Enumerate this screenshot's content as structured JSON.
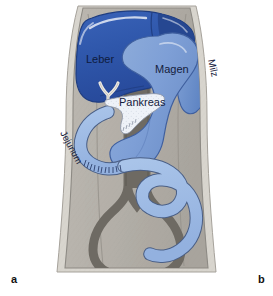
{
  "figure": {
    "panel_letters": {
      "left": "a",
      "right": "b"
    },
    "background_color": "#ffffff"
  },
  "labels": {
    "liver": "Leber",
    "stomach": "Magen",
    "spleen": "Milz",
    "pancreas": "Pankreas",
    "jejunum": "Jejunum"
  },
  "colors": {
    "liver": "#2f57ab",
    "liver_shadow": "#24448c",
    "liver_highlight": "#ffffff",
    "stomach": "#7e9fd6",
    "stomach_shadow": "#6d8fc8",
    "spleen": "#6f94cf",
    "pancreas": "#eef2f8",
    "intestine": "#9dbae4",
    "intestine_outline": "#4a5f86",
    "vessel": "#6e6a63",
    "vessel_dark": "#55524c",
    "body_fill": "#b3afa8",
    "body_wall": "#d8d5ce",
    "body_outline": "#8d8a84",
    "outer_margin": "#ffffff",
    "label_text": "#14203c"
  }
}
